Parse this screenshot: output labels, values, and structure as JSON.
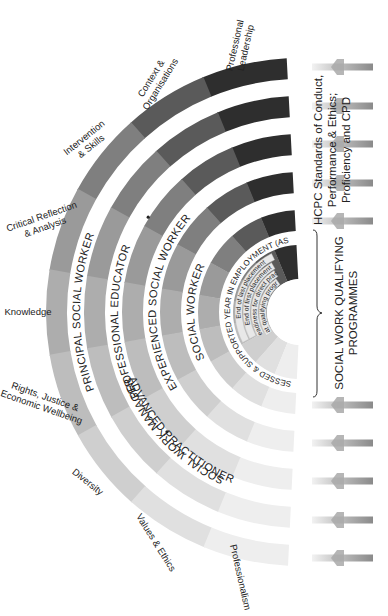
{
  "diagram": {
    "domains": [
      {
        "label": [
          "Professionalism"
        ],
        "color_order": 0
      },
      {
        "label": [
          "Values & Ethics"
        ],
        "color_order": 1
      },
      {
        "label": [
          "Diversity"
        ],
        "color_order": 2
      },
      {
        "label": [
          "Rights, Justice &",
          "Economic Wellbeing"
        ],
        "color_order": 3
      },
      {
        "label": [
          "Knowledge"
        ],
        "color_order": 4
      },
      {
        "label": [
          "Critical Reflection",
          "& Analysis"
        ],
        "color_order": 5
      },
      {
        "label": [
          "Intervention",
          "& Skills"
        ],
        "color_order": 6
      },
      {
        "label": [
          "Context &",
          "Organisations"
        ],
        "color_order": 7
      },
      {
        "label": [
          "Professional",
          "Leadership"
        ],
        "color_order": 8
      }
    ],
    "segment_colors": [
      "#eeeeee",
      "#e0e0e0",
      "#cfcfcf",
      "#bdbdbd",
      "#adadad",
      "#9a9a9a",
      "#7f7f7f",
      "#5a5a5a",
      "#2e2e2e"
    ],
    "levels": [
      {
        "name": "principal-social-worker",
        "label": "PRINCIPAL SOCIAL WORKER"
      },
      {
        "name": "social-work-manager",
        "label": "SOCIAL WORK MANAGER",
        "paired_with": "PROFESSIONAL EDUCATOR"
      },
      {
        "name": "professional-educator",
        "label": "PROFESSIONAL EDUCATOR"
      },
      {
        "name": "advanced-practitioner",
        "label": "ADVANCED PRACTITIONER"
      },
      {
        "name": "experienced-social-worker",
        "label": "EXPERIENCED SOCIAL WORKER"
      },
      {
        "name": "social-worker",
        "label": "SOCIAL WORKER"
      },
      {
        "name": "asye",
        "label": "ASSESSED & SUPPORTED YEAR IN EMPLOYMENT (ASYE)"
      }
    ],
    "qualifying_stages": [
      {
        "label": "End of last placement"
      },
      {
        "label": "End of first placement"
      },
      {
        "label": "Readiness for direct practice"
      },
      {
        "label": "Entry at qualifying programmes"
      }
    ],
    "side_labels": {
      "hcpc": [
        "HCPC Standards of Conduct,",
        "Performance & Ethics;",
        "Proficiency and CPD"
      ],
      "qualifying": [
        "SOCIAL WORK QUALIFYING",
        "PROGRAMMES"
      ]
    },
    "arrows": {
      "top_y": [
        67,
        106,
        144,
        183,
        221
      ],
      "bottom_y": [
        405,
        443,
        481,
        520,
        558
      ],
      "direction": "left"
    }
  }
}
